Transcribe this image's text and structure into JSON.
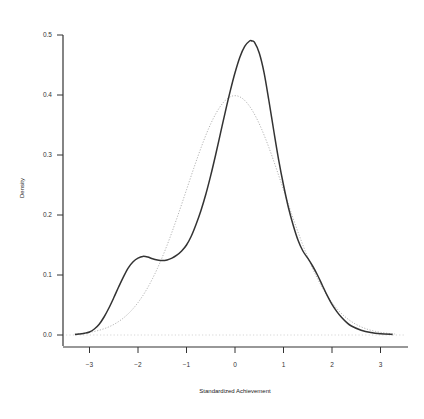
{
  "chart_data": {
    "type": "line",
    "title": "",
    "xlabel": "Standardized Achievement",
    "ylabel": "Density",
    "xlim": [
      -3.5,
      3.5
    ],
    "ylim": [
      0.0,
      0.5
    ],
    "xticks": [
      -3,
      -2,
      -1,
      0,
      1,
      2,
      3
    ],
    "xtick_labels": [
      "-3",
      "-2",
      "-1",
      "0",
      "1",
      "2",
      "3"
    ],
    "yticks": [
      0.0,
      0.1,
      0.2,
      0.3,
      0.4,
      0.5
    ],
    "ytick_labels": [
      "0.0",
      "0.1",
      "0.2",
      "0.3",
      "0.4",
      "0.5"
    ],
    "grid": false,
    "legend": null,
    "series": [
      {
        "name": "Empirical density",
        "style": "solid",
        "color": "#333333",
        "x": [
          -3.3,
          -3.1,
          -3.0,
          -2.9,
          -2.8,
          -2.7,
          -2.6,
          -2.5,
          -2.4,
          -2.3,
          -2.2,
          -2.1,
          -2.0,
          -1.9,
          -1.8,
          -1.7,
          -1.6,
          -1.5,
          -1.4,
          -1.3,
          -1.2,
          -1.1,
          -1.0,
          -0.9,
          -0.8,
          -0.7,
          -0.6,
          -0.5,
          -0.4,
          -0.3,
          -0.2,
          -0.1,
          0.0,
          0.1,
          0.2,
          0.3,
          0.35,
          0.4,
          0.5,
          0.6,
          0.7,
          0.8,
          0.9,
          1.0,
          1.1,
          1.2,
          1.3,
          1.4,
          1.5,
          1.6,
          1.7,
          1.8,
          1.9,
          2.0,
          2.1,
          2.2,
          2.3,
          2.4,
          2.6,
          2.8,
          3.0,
          3.25
        ],
        "y": [
          0.001,
          0.003,
          0.005,
          0.01,
          0.018,
          0.03,
          0.045,
          0.062,
          0.08,
          0.097,
          0.112,
          0.122,
          0.128,
          0.131,
          0.13,
          0.127,
          0.125,
          0.124,
          0.125,
          0.128,
          0.133,
          0.14,
          0.15,
          0.165,
          0.185,
          0.208,
          0.235,
          0.266,
          0.3,
          0.336,
          0.372,
          0.406,
          0.437,
          0.463,
          0.481,
          0.49,
          0.49,
          0.488,
          0.47,
          0.437,
          0.39,
          0.34,
          0.292,
          0.25,
          0.213,
          0.183,
          0.158,
          0.14,
          0.128,
          0.115,
          0.1,
          0.083,
          0.066,
          0.051,
          0.039,
          0.029,
          0.021,
          0.015,
          0.008,
          0.004,
          0.002,
          0.001
        ]
      },
      {
        "name": "Normal density",
        "style": "dotted",
        "color": "#aaaaaa",
        "distribution": "N(0,1)",
        "x_range": [
          -3.3,
          3.3
        ],
        "peak": {
          "x": 0,
          "y": 0.399
        }
      }
    ],
    "baseline": {
      "y": 0.0,
      "style": "dotted",
      "color": "#cccccc"
    }
  }
}
